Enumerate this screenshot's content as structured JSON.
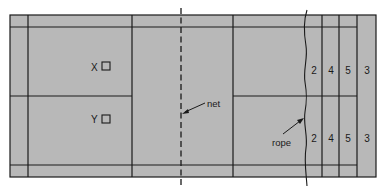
{
  "diagram": {
    "type": "court-layout",
    "colors": {
      "court_fill": "#b8b8b8",
      "line": "#1a1a1a",
      "background": "#ffffff"
    },
    "labels": {
      "net": "net",
      "rope": "rope"
    },
    "positions": [
      {
        "label": "X",
        "marker": "square"
      },
      {
        "label": "Y",
        "marker": "square"
      }
    ],
    "zones": {
      "upper": [
        "2",
        "4",
        "5",
        "3"
      ],
      "lower": [
        "2",
        "4",
        "5",
        "3"
      ]
    }
  }
}
